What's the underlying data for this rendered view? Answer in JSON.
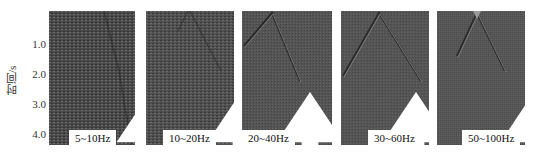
{
  "figure": {
    "y_axis": {
      "label": "时间/s",
      "ticks": [
        "1.0",
        "2.0",
        "3.0",
        "4.0"
      ]
    },
    "panels": [
      {
        "label": "5~10Hz"
      },
      {
        "label": "10~20Hz"
      },
      {
        "label": "20~40Hz"
      },
      {
        "label": "30~60Hz"
      },
      {
        "label": "50~100Hz"
      }
    ]
  }
}
